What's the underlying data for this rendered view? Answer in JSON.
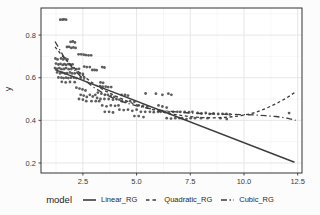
{
  "figure": {
    "ylabel": "y"
  },
  "legend": {
    "title": "model",
    "entries": [
      {
        "label": "Linear_RG",
        "style": "solid"
      },
      {
        "label": "Quadratic_RG",
        "style": "dashed"
      },
      {
        "label": "Cubic_RG",
        "style": "dashdot"
      }
    ]
  },
  "chart_data": {
    "type": "scatter",
    "title": "",
    "xlabel": "",
    "ylabel": "y",
    "legend_title": "model",
    "legend_position": "bottom",
    "grid": "major+minor",
    "x_range": [
      0.55,
      12.7
    ],
    "y_range": [
      0.153,
      0.927
    ],
    "x_ticks": [
      2.5,
      5.0,
      7.5,
      10.0,
      12.5
    ],
    "x_tick_labels": [
      "2.5",
      "5.0",
      "7.5",
      "10.0",
      "12.5"
    ],
    "x_minor_ticks": [
      1.25,
      3.75,
      6.25,
      8.75,
      11.25
    ],
    "y_ticks": [
      0.2,
      0.4,
      0.6,
      0.8
    ],
    "y_tick_labels": [
      "0.2",
      "0.4",
      "0.6",
      "0.8"
    ],
    "y_minor_ticks": [
      0.3,
      0.5,
      0.7,
      0.9
    ],
    "colors": {
      "point": "#4d4d4d",
      "line": "#3d3d3d",
      "grid_major": "#e3e3e3",
      "grid_minor": "#f1f1f1",
      "frame": "#333333",
      "tick_text": "#3a3a3a",
      "panel_bg": "#ffffff"
    },
    "points": [
      [
        1.45,
        0.872
      ],
      [
        1.55,
        0.872
      ],
      [
        1.62,
        0.874
      ],
      [
        1.72,
        0.872
      ],
      [
        1.93,
        0.768
      ],
      [
        2.03,
        0.77
      ],
      [
        2.13,
        0.765
      ],
      [
        1.76,
        0.744
      ],
      [
        1.86,
        0.745
      ],
      [
        1.96,
        0.74
      ],
      [
        2.06,
        0.742
      ],
      [
        2.16,
        0.74
      ],
      [
        2.3,
        0.71
      ],
      [
        2.42,
        0.71
      ],
      [
        2.54,
        0.708
      ],
      [
        2.64,
        0.706
      ],
      [
        2.76,
        0.705
      ],
      [
        2.88,
        0.705
      ],
      [
        1.22,
        0.69
      ],
      [
        1.32,
        0.686
      ],
      [
        1.48,
        0.69
      ],
      [
        1.58,
        0.686
      ],
      [
        1.68,
        0.69
      ],
      [
        1.78,
        0.686
      ],
      [
        1.25,
        0.666
      ],
      [
        1.36,
        0.662
      ],
      [
        1.46,
        0.665
      ],
      [
        1.56,
        0.66
      ],
      [
        1.64,
        0.664
      ],
      [
        1.72,
        0.66
      ],
      [
        1.82,
        0.664
      ],
      [
        1.92,
        0.661
      ],
      [
        2.02,
        0.663
      ],
      [
        1.2,
        0.645
      ],
      [
        1.3,
        0.642
      ],
      [
        1.4,
        0.645
      ],
      [
        1.5,
        0.64
      ],
      [
        1.62,
        0.641
      ],
      [
        1.72,
        0.645
      ],
      [
        1.84,
        0.64
      ],
      [
        1.96,
        0.641
      ],
      [
        2.06,
        0.645
      ],
      [
        2.2,
        0.64
      ],
      [
        2.32,
        0.642
      ],
      [
        1.3,
        0.625
      ],
      [
        1.44,
        0.62
      ],
      [
        1.54,
        0.624
      ],
      [
        1.66,
        0.62
      ],
      [
        1.76,
        0.621
      ],
      [
        1.9,
        0.625
      ],
      [
        2.0,
        0.62
      ],
      [
        2.12,
        0.62
      ],
      [
        2.24,
        0.624
      ],
      [
        2.36,
        0.62
      ],
      [
        2.5,
        0.618
      ],
      [
        1.36,
        0.601
      ],
      [
        1.5,
        0.6
      ],
      [
        1.6,
        0.598
      ],
      [
        1.72,
        0.6
      ],
      [
        1.82,
        0.598
      ],
      [
        1.94,
        0.6
      ],
      [
        2.08,
        0.6
      ],
      [
        2.2,
        0.598
      ],
      [
        2.4,
        0.6
      ],
      [
        2.56,
        0.6
      ],
      [
        1.52,
        0.581
      ],
      [
        1.7,
        0.578
      ],
      [
        1.9,
        0.58
      ],
      [
        2.12,
        0.579
      ],
      [
        2.56,
        0.652
      ],
      [
        2.68,
        0.65
      ],
      [
        2.82,
        0.65
      ],
      [
        2.94,
        0.636
      ],
      [
        3.04,
        0.636
      ],
      [
        3.14,
        0.635
      ],
      [
        3.4,
        0.65
      ],
      [
        3.5,
        0.648
      ],
      [
        3.3,
        0.56
      ],
      [
        3.42,
        0.558
      ],
      [
        3.56,
        0.558
      ],
      [
        3.68,
        0.556
      ],
      [
        3.82,
        0.556
      ],
      [
        3.32,
        0.578
      ],
      [
        3.44,
        0.576
      ],
      [
        2.2,
        0.553
      ],
      [
        2.34,
        0.549
      ],
      [
        2.48,
        0.545
      ],
      [
        2.62,
        0.54
      ],
      [
        2.4,
        0.52
      ],
      [
        2.54,
        0.516
      ],
      [
        2.68,
        0.51
      ],
      [
        2.82,
        0.52
      ],
      [
        2.96,
        0.512
      ],
      [
        3.08,
        0.52
      ],
      [
        2.32,
        0.5
      ],
      [
        2.5,
        0.497
      ],
      [
        2.66,
        0.49
      ],
      [
        2.9,
        0.49
      ],
      [
        3.1,
        0.49
      ],
      [
        3.26,
        0.49
      ],
      [
        3.2,
        0.53
      ],
      [
        3.36,
        0.525
      ],
      [
        3.52,
        0.52
      ],
      [
        3.66,
        0.52
      ],
      [
        3.8,
        0.515
      ],
      [
        3.96,
        0.51
      ],
      [
        3.16,
        0.505
      ],
      [
        3.32,
        0.5
      ],
      [
        3.5,
        0.5
      ],
      [
        3.7,
        0.5
      ],
      [
        3.9,
        0.497
      ],
      [
        4.06,
        0.5
      ],
      [
        4.2,
        0.497
      ],
      [
        3.4,
        0.47
      ],
      [
        3.6,
        0.466
      ],
      [
        3.8,
        0.47
      ],
      [
        4.0,
        0.468
      ],
      [
        4.16,
        0.47
      ],
      [
        4.3,
        0.52
      ],
      [
        4.46,
        0.52
      ],
      [
        4.6,
        0.516
      ],
      [
        4.32,
        0.49
      ],
      [
        4.5,
        0.487
      ],
      [
        4.7,
        0.49
      ],
      [
        4.9,
        0.487
      ],
      [
        4.2,
        0.45
      ],
      [
        4.4,
        0.448
      ],
      [
        4.6,
        0.45
      ],
      [
        4.8,
        0.445
      ],
      [
        5.0,
        0.45
      ],
      [
        3.52,
        0.44
      ],
      [
        3.72,
        0.44
      ],
      [
        3.9,
        0.437
      ],
      [
        5.1,
        0.47
      ],
      [
        5.3,
        0.468
      ],
      [
        5.5,
        0.465
      ],
      [
        5.2,
        0.44
      ],
      [
        5.4,
        0.44
      ],
      [
        5.62,
        0.44
      ],
      [
        5.8,
        0.438
      ],
      [
        6.0,
        0.44
      ],
      [
        5.42,
        0.526
      ],
      [
        5.9,
        0.525
      ],
      [
        6.2,
        0.52
      ],
      [
        6.48,
        0.525
      ],
      [
        6.62,
        0.52
      ],
      [
        4.9,
        0.42
      ],
      [
        5.1,
        0.42
      ],
      [
        5.32,
        0.415
      ],
      [
        6.02,
        0.47
      ],
      [
        6.2,
        0.465
      ],
      [
        6.4,
        0.46
      ],
      [
        6.12,
        0.44
      ],
      [
        6.32,
        0.44
      ],
      [
        6.5,
        0.438
      ],
      [
        6.7,
        0.44
      ],
      [
        6.9,
        0.44
      ],
      [
        6.4,
        0.41
      ],
      [
        6.6,
        0.408
      ],
      [
        6.8,
        0.41
      ],
      [
        7.0,
        0.41
      ],
      [
        7.04,
        0.44
      ],
      [
        7.24,
        0.44
      ],
      [
        7.44,
        0.438
      ],
      [
        7.6,
        0.44
      ],
      [
        7.12,
        0.41
      ],
      [
        7.32,
        0.406
      ],
      [
        7.52,
        0.41
      ],
      [
        7.72,
        0.41
      ],
      [
        7.84,
        0.435
      ],
      [
        8.02,
        0.432
      ],
      [
        8.22,
        0.435
      ],
      [
        8.4,
        0.43
      ],
      [
        8.58,
        0.432
      ],
      [
        8.0,
        0.41
      ],
      [
        8.3,
        0.41
      ],
      [
        8.8,
        0.43
      ],
      [
        9.0,
        0.43
      ],
      [
        9.18,
        0.43
      ],
      [
        9.34,
        0.428
      ],
      [
        8.9,
        0.41
      ],
      [
        9.2,
        0.406
      ],
      [
        12.1,
        0.434
      ]
    ],
    "series": [
      {
        "name": "Linear_RG",
        "style": "solid",
        "values": [
          [
            1.2,
            0.638
          ],
          [
            12.35,
            0.203
          ]
        ]
      },
      {
        "name": "Quadratic_RG",
        "style": "dashed",
        "values": [
          [
            1.2,
            0.745
          ],
          [
            1.6,
            0.695
          ],
          [
            2.0,
            0.655
          ],
          [
            2.5,
            0.61
          ],
          [
            3.0,
            0.572
          ],
          [
            3.5,
            0.54
          ],
          [
            4.0,
            0.515
          ],
          [
            4.5,
            0.492
          ],
          [
            5.0,
            0.473
          ],
          [
            5.5,
            0.457
          ],
          [
            6.0,
            0.444
          ],
          [
            6.5,
            0.432
          ],
          [
            7.0,
            0.424
          ],
          [
            7.5,
            0.417
          ],
          [
            8.0,
            0.413
          ],
          [
            8.5,
            0.412
          ],
          [
            9.0,
            0.413
          ],
          [
            9.5,
            0.417
          ],
          [
            10.0,
            0.424
          ],
          [
            10.5,
            0.436
          ],
          [
            11.0,
            0.455
          ],
          [
            11.5,
            0.478
          ],
          [
            12.0,
            0.506
          ],
          [
            12.35,
            0.53
          ]
        ]
      },
      {
        "name": "Cubic_RG",
        "style": "dashdot",
        "values": [
          [
            1.2,
            0.77
          ],
          [
            1.6,
            0.7
          ],
          [
            2.0,
            0.648
          ],
          [
            2.5,
            0.595
          ],
          [
            3.0,
            0.555
          ],
          [
            3.5,
            0.524
          ],
          [
            4.0,
            0.5
          ],
          [
            4.5,
            0.482
          ],
          [
            5.0,
            0.468
          ],
          [
            5.5,
            0.457
          ],
          [
            6.0,
            0.449
          ],
          [
            6.5,
            0.443
          ],
          [
            7.0,
            0.438
          ],
          [
            7.5,
            0.434
          ],
          [
            8.0,
            0.432
          ],
          [
            8.5,
            0.43
          ],
          [
            9.0,
            0.429
          ],
          [
            9.5,
            0.428
          ],
          [
            10.0,
            0.427
          ],
          [
            10.5,
            0.425
          ],
          [
            11.0,
            0.422
          ],
          [
            11.5,
            0.418
          ],
          [
            12.0,
            0.41
          ],
          [
            12.4,
            0.4
          ]
        ]
      }
    ]
  }
}
